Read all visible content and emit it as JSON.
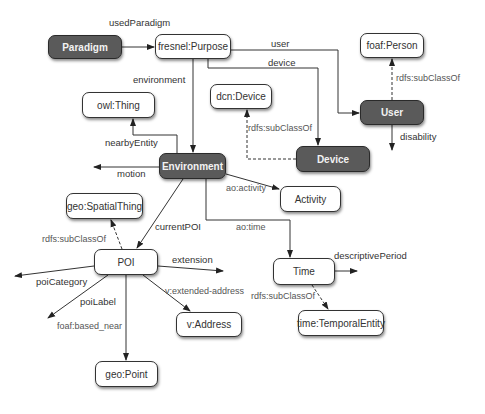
{
  "colors": {
    "dark_node": "#5a5a5a",
    "light_node": "#ffffff",
    "edge": "#333333"
  },
  "nodes": [
    {
      "id": "paradigm",
      "label": "Paradigm",
      "style": "dark",
      "x": 48,
      "y": 35,
      "w": 74,
      "h": 24
    },
    {
      "id": "purpose",
      "label": "fresnel:Purpose",
      "style": "light",
      "x": 155,
      "y": 34,
      "w": 76,
      "h": 25
    },
    {
      "id": "person",
      "label": "foaf:Person",
      "style": "light",
      "x": 360,
      "y": 33,
      "w": 64,
      "h": 25
    },
    {
      "id": "owlthing",
      "label": "owl:Thing",
      "style": "light",
      "x": 82,
      "y": 92,
      "w": 73,
      "h": 26
    },
    {
      "id": "dcndevice",
      "label": "dcn:Device",
      "style": "light",
      "x": 210,
      "y": 84,
      "w": 62,
      "h": 25
    },
    {
      "id": "user",
      "label": "User",
      "style": "dark",
      "x": 360,
      "y": 100,
      "w": 64,
      "h": 25
    },
    {
      "id": "device",
      "label": "Device",
      "style": "dark",
      "x": 296,
      "y": 146,
      "w": 74,
      "h": 26
    },
    {
      "id": "environment",
      "label": "Environment",
      "style": "dark",
      "x": 159,
      "y": 153,
      "w": 67,
      "h": 26
    },
    {
      "id": "activity",
      "label": "Activity",
      "style": "light",
      "x": 280,
      "y": 186,
      "w": 61,
      "h": 26
    },
    {
      "id": "spatial",
      "label": "geo:SpatialThing",
      "style": "light",
      "x": 66,
      "y": 193,
      "w": 77,
      "h": 26
    },
    {
      "id": "poi",
      "label": "POI",
      "style": "light",
      "x": 94,
      "y": 249,
      "w": 64,
      "h": 26
    },
    {
      "id": "time",
      "label": "Time",
      "style": "light",
      "x": 273,
      "y": 258,
      "w": 62,
      "h": 27
    },
    {
      "id": "address",
      "label": "v:Address",
      "style": "light",
      "x": 176,
      "y": 312,
      "w": 66,
      "h": 25
    },
    {
      "id": "temporal",
      "label": "time:TemporalEntity",
      "style": "light",
      "x": 298,
      "y": 310,
      "w": 86,
      "h": 26
    },
    {
      "id": "point",
      "label": "geo:Point",
      "style": "light",
      "x": 95,
      "y": 361,
      "w": 63,
      "h": 26
    }
  ],
  "edge_labels": [
    {
      "id": "usedParadigm",
      "text": "usedParadigm",
      "x": 109,
      "y": 17,
      "sub": false
    },
    {
      "id": "user",
      "text": "user",
      "x": 271,
      "y": 38,
      "sub": false
    },
    {
      "id": "device",
      "text": "device",
      "x": 268,
      "y": 57,
      "sub": false
    },
    {
      "id": "environment",
      "text": "environment",
      "x": 133,
      "y": 74,
      "sub": false
    },
    {
      "id": "person_sub",
      "text": "rdfs:subClassOf",
      "x": 396,
      "y": 73,
      "sub": true
    },
    {
      "id": "disability",
      "text": "disability",
      "x": 400,
      "y": 131,
      "sub": false
    },
    {
      "id": "dcn_sub",
      "text": "rdfs:subClassOf",
      "x": 248,
      "y": 123,
      "sub": true
    },
    {
      "id": "nearbyEntity",
      "text": "nearbyEntity",
      "x": 105,
      "y": 137,
      "sub": false
    },
    {
      "id": "motion",
      "text": "motion",
      "x": 117,
      "y": 168,
      "sub": false
    },
    {
      "id": "aoactivity",
      "text": "ao:activity",
      "x": 226,
      "y": 183,
      "sub": true
    },
    {
      "id": "currentPOI",
      "text": "currentPOI",
      "x": 155,
      "y": 221,
      "sub": false
    },
    {
      "id": "aotime",
      "text": "ao:time",
      "x": 236,
      "y": 222,
      "sub": true
    },
    {
      "id": "spatial_sub",
      "text": "rdfs:subClassOf",
      "x": 42,
      "y": 234,
      "sub": true
    },
    {
      "id": "extension",
      "text": "extension",
      "x": 172,
      "y": 254,
      "sub": false
    },
    {
      "id": "descriptivePeriod",
      "text": "descriptivePeriod",
      "x": 334,
      "y": 250,
      "sub": false
    },
    {
      "id": "poiCategory",
      "text": "poiCategory",
      "x": 36,
      "y": 276,
      "sub": false
    },
    {
      "id": "extaddress",
      "text": "v:extended-address",
      "x": 165,
      "y": 286,
      "sub": true
    },
    {
      "id": "time_sub",
      "text": "rdfs:subClassOf",
      "x": 251,
      "y": 291,
      "sub": true
    },
    {
      "id": "poiLabel",
      "text": "poiLabel",
      "x": 80,
      "y": 296,
      "sub": false
    },
    {
      "id": "based_near",
      "text": "foaf:based_near",
      "x": 57,
      "y": 321,
      "sub": true
    }
  ]
}
